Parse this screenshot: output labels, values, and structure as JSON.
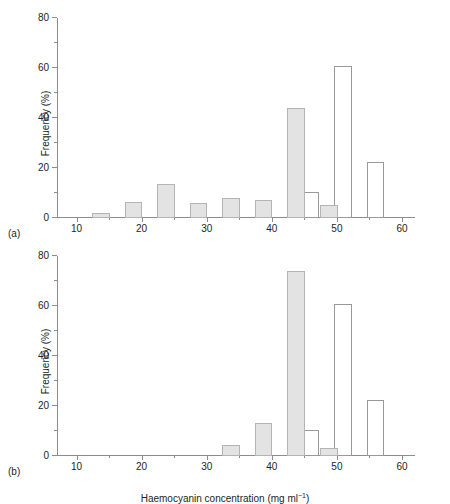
{
  "figure": {
    "panel_a_tag": "(a)",
    "panel_b_tag": "(b)"
  },
  "chart_data": [
    {
      "panel": "(a)",
      "type": "bar",
      "title": "",
      "xlabel": "Haemocyanin concentration (mg ml⁻¹)",
      "ylabel": "Frequency (%)",
      "xlim": [
        7,
        62
      ],
      "ylim": [
        0,
        80
      ],
      "xticks": [
        10,
        20,
        30,
        40,
        50,
        60
      ],
      "xtick_labels": [
        "10",
        "20",
        "30",
        "40",
        "50",
        "60"
      ],
      "xminor_step": 5,
      "yticks": [
        0,
        20,
        40,
        60,
        80
      ],
      "ytick_labels": [
        "0",
        "20",
        "40",
        "60",
        "80"
      ],
      "yminor_step": 10,
      "grid": false,
      "legend": "none",
      "series": [
        {
          "name": "filled",
          "style": "grey-filled",
          "bars": [
            {
              "x0": 12.4,
              "x1": 15.1,
              "value": 2.0
            },
            {
              "x0": 17.4,
              "x1": 20.1,
              "value": 6.3
            },
            {
              "x0": 22.4,
              "x1": 25.1,
              "value": 13.6
            },
            {
              "x0": 27.4,
              "x1": 30.1,
              "value": 6.1
            },
            {
              "x0": 32.4,
              "x1": 35.1,
              "value": 8.2
            },
            {
              "x0": 37.4,
              "x1": 40.1,
              "value": 7.4
            },
            {
              "x0": 42.4,
              "x1": 45.1,
              "value": 44.1
            },
            {
              "x0": 47.4,
              "x1": 50.1,
              "value": 5.4
            }
          ]
        },
        {
          "name": "open",
          "style": "white-open",
          "bars": [
            {
              "x0": 44.6,
              "x1": 47.3,
              "value": 10.6
            },
            {
              "x0": 49.6,
              "x1": 52.3,
              "value": 61.0
            },
            {
              "x0": 54.6,
              "x1": 57.3,
              "value": 22.5
            }
          ]
        }
      ]
    },
    {
      "panel": "(b)",
      "type": "bar",
      "title": "",
      "xlabel": "Haemocyanin concentration (mg ml⁻¹)",
      "ylabel": "Frequency (%)",
      "xlim": [
        7,
        62
      ],
      "ylim": [
        0,
        80
      ],
      "xticks": [
        10,
        20,
        30,
        40,
        50,
        60
      ],
      "xtick_labels": [
        "10",
        "20",
        "30",
        "40",
        "50",
        "60"
      ],
      "xminor_step": 5,
      "yticks": [
        0,
        20,
        40,
        60,
        80
      ],
      "ytick_labels": [
        "0",
        "20",
        "40",
        "60",
        "80"
      ],
      "yminor_step": 10,
      "grid": false,
      "legend": "none",
      "series": [
        {
          "name": "filled",
          "style": "grey-filled",
          "bars": [
            {
              "x0": 32.4,
              "x1": 35.1,
              "value": 4.5
            },
            {
              "x0": 37.4,
              "x1": 40.1,
              "value": 13.4
            },
            {
              "x0": 42.4,
              "x1": 45.1,
              "value": 73.9
            },
            {
              "x0": 47.4,
              "x1": 50.1,
              "value": 3.3
            }
          ]
        },
        {
          "name": "open",
          "style": "white-open",
          "bars": [
            {
              "x0": 44.6,
              "x1": 47.3,
              "value": 10.6
            },
            {
              "x0": 49.6,
              "x1": 52.3,
              "value": 61.0
            },
            {
              "x0": 54.6,
              "x1": 57.3,
              "value": 22.5
            }
          ]
        }
      ]
    }
  ]
}
